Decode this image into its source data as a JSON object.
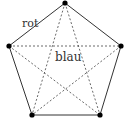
{
  "diagram": {
    "type": "complete-graph-K5",
    "labels": {
      "outer": "rot",
      "inner": "blau"
    },
    "colors": {
      "edge": "#333333",
      "vertex": "#000000",
      "background": "#ffffff"
    },
    "vertices": [
      {
        "id": "top",
        "x": 65,
        "y": 3
      },
      {
        "id": "right",
        "x": 121,
        "y": 46
      },
      {
        "id": "bottom-right",
        "x": 100,
        "y": 115
      },
      {
        "id": "bottom-left",
        "x": 32,
        "y": 115
      },
      {
        "id": "left",
        "x": 9,
        "y": 46
      }
    ],
    "outer_edges": [
      [
        "top",
        "right"
      ],
      [
        "right",
        "bottom-right"
      ],
      [
        "bottom-right",
        "bottom-left"
      ],
      [
        "bottom-left",
        "left"
      ],
      [
        "left",
        "top"
      ]
    ],
    "inner_edges": [
      [
        "top",
        "bottom-right"
      ],
      [
        "top",
        "bottom-left"
      ],
      [
        "left",
        "right"
      ],
      [
        "left",
        "bottom-right"
      ],
      [
        "right",
        "bottom-left"
      ]
    ]
  }
}
